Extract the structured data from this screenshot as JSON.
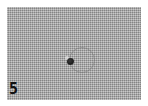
{
  "image": {
    "description": "Grayscale micrograph of woven textured surface with a small dark particle and faint circular ring",
    "panel_label": "5",
    "colors": {
      "background": "#a9a9a9",
      "border": "#ffffff",
      "label": "#111111"
    }
  }
}
